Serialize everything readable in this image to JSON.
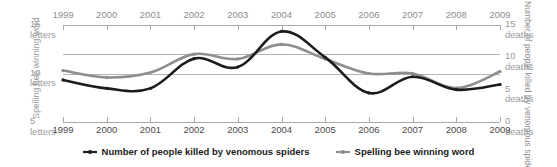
{
  "chart_data": {
    "type": "line",
    "title": "",
    "xlabel": "",
    "categories": [
      1999,
      2000,
      2001,
      2002,
      2003,
      2004,
      2005,
      2006,
      2007,
      2008,
      2009
    ],
    "x_tick_labels": [
      "1999",
      "2000",
      "2001",
      "2002",
      "2003",
      "2004",
      "2005",
      "2006",
      "2007",
      "2008",
      "2009"
    ],
    "grid": true,
    "legend_position": "bottom",
    "series": [
      {
        "name": "Number of people killed by venomous spiders",
        "axis": "right",
        "color": "#1c1c1c",
        "unit": "deaths",
        "values": [
          6.5,
          5.2,
          5.2,
          9.8,
          8.5,
          14.0,
          10.0,
          4.5,
          7.0,
          5.0,
          5.8
        ]
      },
      {
        "name": "Spelling bee winning word",
        "axis": "left",
        "color": "#8e8e8e",
        "unit": "letters",
        "values": [
          10.3,
          9.6,
          10.1,
          12.0,
          11.5,
          13.0,
          11.5,
          10.0,
          10.0,
          8.5,
          10.2
        ]
      }
    ],
    "left_axis": {
      "title": "Spelling bee winning word",
      "unit": "letters",
      "ylim": [
        5,
        15
      ],
      "ticks": [
        {
          "value": 15,
          "num": "15",
          "unit": "letters"
        },
        {
          "value": 10,
          "num": "10",
          "unit": "letters"
        },
        {
          "value": 5,
          "num": "5",
          "unit": "letters"
        }
      ],
      "gridline_values": [
        15,
        12,
        10
      ]
    },
    "right_axis": {
      "title": "Number of people killed by venomous spiders",
      "unit": "deaths",
      "ylim": [
        0,
        15
      ],
      "ticks": [
        {
          "value": 15,
          "num": "15",
          "unit": "deaths"
        },
        {
          "value": 10,
          "num": "10",
          "unit": "deaths"
        },
        {
          "value": 5,
          "num": "5",
          "unit": "deaths"
        },
        {
          "value": 0,
          "num": "0",
          "unit": "deaths"
        }
      ]
    }
  },
  "legend": {
    "items": [
      {
        "label": "Number of people killed by venomous spiders",
        "color": "#1c1c1c"
      },
      {
        "label": "Spelling bee winning word",
        "color": "#8e8e8e"
      }
    ]
  }
}
